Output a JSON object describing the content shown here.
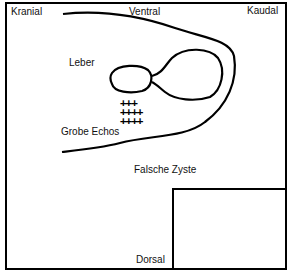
{
  "labels": {
    "kranial": "Kranial",
    "ventral": "Ventral",
    "kaudal": "Kaudal",
    "leber": "Leber",
    "grobe_echos": "Grobe Echos",
    "falsche_zyste": "Falsche Zyste",
    "dorsal": "Dorsal"
  },
  "echo_marks": {
    "symbol": "+",
    "rows": [
      "+++",
      "++++",
      "++++"
    ]
  },
  "colors": {
    "line": "#000000",
    "background": "#ffffff"
  }
}
